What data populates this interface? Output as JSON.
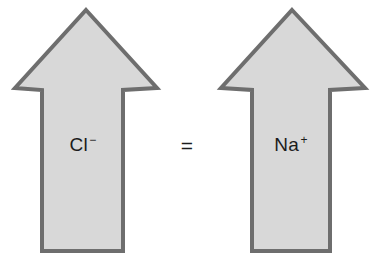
{
  "canvas": {
    "width": 372,
    "height": 257,
    "background": "#ffffff"
  },
  "style": {
    "arrow_fill": "#d8d8d8",
    "arrow_stroke": "#6e6e6e",
    "arrow_stroke_width": 4,
    "text_color": "#1c1c1c"
  },
  "diagram": {
    "type": "equivalence",
    "relation_symbol": "=",
    "arrows": [
      {
        "id": "left-arrow",
        "direction": "up",
        "label_element": "Cl",
        "label_charge": "−",
        "label_full": "Cl⁻",
        "geometry": {
          "apex_x": 86,
          "apex_y": 10,
          "head_left_x": 15,
          "head_right_x": 157,
          "head_base_y": 88,
          "shoulder_y": 90,
          "shaft_left_x": 42,
          "shaft_right_x": 123,
          "bottom_y": 251
        },
        "label_position": {
          "x": 83,
          "y": 145
        }
      },
      {
        "id": "right-arrow",
        "direction": "up",
        "label_element": "Na",
        "label_charge": "+",
        "label_full": "Na⁺",
        "geometry": {
          "apex_x": 292,
          "apex_y": 10,
          "head_left_x": 221,
          "head_right_x": 365,
          "head_base_y": 88,
          "shoulder_y": 90,
          "shaft_left_x": 252,
          "shaft_right_x": 330,
          "bottom_y": 251
        },
        "label_position": {
          "x": 291,
          "y": 145
        }
      }
    ],
    "relation_position": {
      "x": 187,
      "y": 146
    }
  }
}
